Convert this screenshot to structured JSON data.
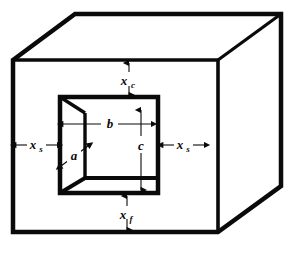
{
  "figure": {
    "type": "engineering-dimension-diagram",
    "projection": "oblique / cabinet",
    "colors": {
      "line": "#0a0a0a",
      "background": "#ffffff",
      "fill": "#ffffff"
    }
  },
  "labels": {
    "top_clearance": {
      "symbol": "x",
      "subscript": "c",
      "position": "top-center",
      "arrow": "vertical-double"
    },
    "bottom_clearance": {
      "symbol": "x",
      "subscript": "f",
      "position": "bottom-center",
      "arrow": "vertical-double"
    },
    "left_clearance": {
      "symbol": "x",
      "subscript": "s",
      "position": "left-center",
      "arrow": "horizontal-double"
    },
    "right_clearance": {
      "symbol": "x",
      "subscript": "s",
      "position": "right-center",
      "arrow": "horizontal-double"
    },
    "cavity_width": {
      "symbol": "b",
      "subscript": "",
      "position": "cavity-upper-center",
      "arrow": "horizontal-double"
    },
    "cavity_height": {
      "symbol": "c",
      "subscript": "",
      "position": "cavity-right-center",
      "arrow": "vertical-double"
    },
    "cavity_depth": {
      "symbol": "a",
      "subscript": "",
      "position": "cavity-left-oblique",
      "arrow": "diagonal-double"
    }
  },
  "geometry": {
    "outer_front_face": "13,60 218,60 218,232 13,232",
    "outer_top_edge": "13,60 75,14 281,14 218,60",
    "outer_right_edge": "218,60 281,14 281,186 218,232",
    "inner_cavity_front": "60,97 158,97 158,193 60,193",
    "inner_left_wall": "60,97 85,113 85,178 60,193",
    "inner_floor": "60,193 85,178 158,178 158,193"
  }
}
